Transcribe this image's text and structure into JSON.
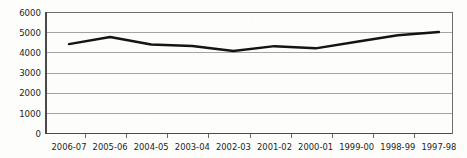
{
  "chart_data": {
    "type": "line",
    "title": "",
    "subtitle": "",
    "xlabel": "",
    "ylabel": "",
    "categories": [
      "2006-07",
      "2005-06",
      "2004-05",
      "2003-04",
      "2002-03",
      "2001-02",
      "2000-01",
      "1999-00",
      "1998-99",
      "1997-98"
    ],
    "series": [
      {
        "name": "",
        "values": [
          4430,
          4780,
          4410,
          4340,
          4090,
          4330,
          4220,
          4550,
          4870,
          5030
        ]
      }
    ],
    "ylim": [
      0,
      6000
    ],
    "yticks": [
      0,
      1000,
      2000,
      3000,
      4000,
      5000,
      6000
    ],
    "ytick_labels": [
      "0",
      "1000",
      "2000",
      "3000",
      "4000",
      "5000",
      "6000"
    ],
    "grid": true,
    "grid_axis": "y",
    "legend": false,
    "legend_position": "none",
    "line_color": "#141414",
    "gridline_color": "#8d8d8d",
    "axis_color": "#6f6f6f",
    "background_color": "#fdfdfc",
    "markers": false,
    "annotations": []
  }
}
